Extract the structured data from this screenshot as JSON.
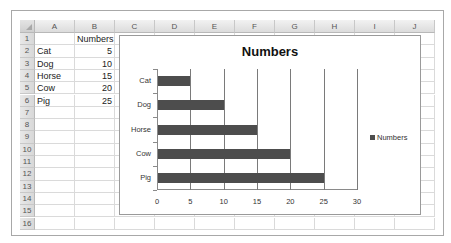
{
  "spreadsheet": {
    "columns": [
      "A",
      "B",
      "C",
      "D",
      "E",
      "F",
      "G",
      "H",
      "I",
      "J"
    ],
    "rows": [
      "1",
      "2",
      "3",
      "4",
      "5",
      "6",
      "7",
      "8",
      "9",
      "10",
      "11",
      "12",
      "13",
      "14",
      "15",
      "16"
    ],
    "cells": {
      "B1": "Numbers",
      "A2": "Cat",
      "B2": "5",
      "A3": "Dog",
      "B3": "10",
      "A4": "Horse",
      "B4": "15",
      "A5": "Cow",
      "B5": "20",
      "A6": "Pig",
      "B6": "25"
    }
  },
  "chart_data": {
    "type": "bar",
    "orientation": "horizontal",
    "title": "Numbers",
    "categories": [
      "Cat",
      "Dog",
      "Horse",
      "Cow",
      "Pig"
    ],
    "series": [
      {
        "name": "Numbers",
        "values": [
          5,
          10,
          15,
          20,
          25
        ],
        "color": "#4d4d4d"
      }
    ],
    "xlabel": "",
    "ylabel": "",
    "xlim": [
      0,
      30
    ],
    "x_ticks": [
      "0",
      "5",
      "10",
      "15",
      "20",
      "25",
      "30"
    ],
    "grid": "vertical major gridlines",
    "legend_position": "right",
    "legend": [
      "Numbers"
    ]
  }
}
